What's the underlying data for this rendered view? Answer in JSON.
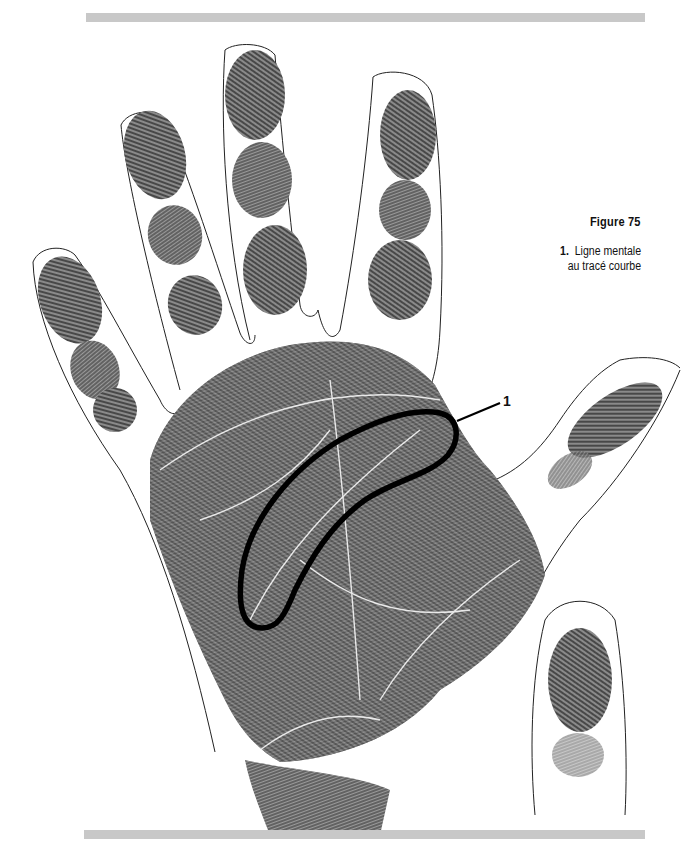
{
  "figure": {
    "title": "Figure 75",
    "legend": [
      {
        "number": "1.",
        "line1": "Ligne mentale",
        "line2": "au tracé courbe"
      }
    ],
    "callouts": [
      {
        "label": "1",
        "target": "curved-head-line"
      }
    ]
  },
  "illustration": {
    "subject": "palm-print-right-hand",
    "ink_color": "#2a2a2a",
    "outline_color": "#222222",
    "highlight_color": "#000000",
    "rule_color": "#c8c8c8"
  }
}
